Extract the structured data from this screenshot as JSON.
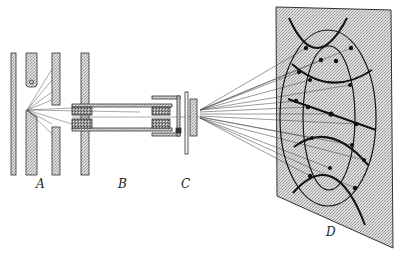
{
  "figure": {
    "type": "schematic diagram",
    "colors": {
      "line": "#222222",
      "stipple_fill": "#c8c8c8",
      "dense_fill": "#8a8a8a",
      "background": "#ffffff"
    }
  },
  "labels": {
    "A": "A",
    "B": "B",
    "C": "C",
    "D": "D"
  },
  "components": [
    {
      "id": "A",
      "name": "emitter and aperture plates"
    },
    {
      "id": "B",
      "name": "tube with lens assembly"
    },
    {
      "id": "C",
      "name": "end aperture flange"
    },
    {
      "id": "D",
      "name": "projection screen with pattern"
    }
  ]
}
